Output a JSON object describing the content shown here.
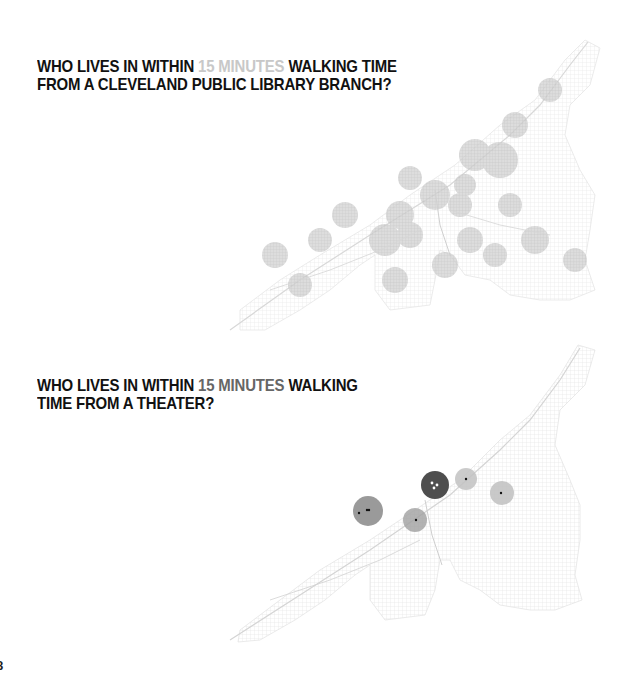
{
  "panels": [
    {
      "title_pre": "WHO LIVES IN WITHIN ",
      "title_highlight": "15 MINUTES",
      "title_post_line1": " WALKING TIME",
      "title_line2": "FROM A CLEVELAND PUBLIC LIBRARY BRANCH?",
      "highlight_color": "#c8c8c8",
      "map": "cleveland-street-network-library-walksheds"
    },
    {
      "title_pre": "WHO LIVES IN WITHIN ",
      "title_highlight": "15 MINUTES",
      "title_post_line1": " WALKING",
      "title_line2": "TIME FROM A THEATER?",
      "highlight_color": "#666666",
      "map": "cleveland-street-network-theater-walksheds"
    }
  ],
  "page_number": "8",
  "colors": {
    "text": "#111111",
    "street_light": "#dcdcdc",
    "walkshed_light": "#c4c4c4",
    "walkshed_mid": "#9a9a9a",
    "walkshed_dark": "#555555"
  }
}
